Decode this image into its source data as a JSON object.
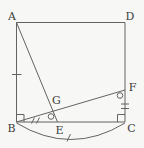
{
  "diagram": {
    "type": "geometry-figure",
    "labels": {
      "A": "A",
      "B": "B",
      "C": "C",
      "D": "D",
      "E": "E",
      "F": "F",
      "G": "G"
    },
    "marks": [
      "single-tick-on-AB-midpoint",
      "double-tick-on-BE",
      "double-tick-on-FC",
      "right-angle-at-B",
      "right-angle-at-C",
      "angle-circle-near-E",
      "angle-circle-near-F",
      "arc-from-B-to-C",
      "single-tick-on-arc"
    ],
    "colors": {
      "background": "#f7f7f6",
      "line": "#636363",
      "label": "#3c3c3c"
    }
  }
}
